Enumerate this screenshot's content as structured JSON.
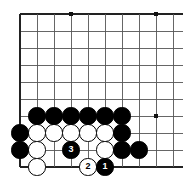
{
  "diagram": {
    "kind": "go-board-diagram",
    "board": {
      "origin_x": 20,
      "origin_y": 14,
      "spacing": 17,
      "cols": 10,
      "rows": 10,
      "left_edge_col": 0,
      "top_edge_row": 0,
      "bottom_edge_row": 9,
      "line_color": "#555555",
      "edge_color": "#222222",
      "background": "#ffffff"
    },
    "star_points": [
      {
        "col": 3,
        "row": 0
      },
      {
        "col": 8,
        "row": 0
      },
      {
        "col": 8,
        "row": 6
      }
    ],
    "stones": [
      {
        "col": 0,
        "row": 7,
        "color": "black",
        "label": ""
      },
      {
        "col": 0,
        "row": 8,
        "color": "black",
        "label": ""
      },
      {
        "col": 1,
        "row": 6,
        "color": "black",
        "label": ""
      },
      {
        "col": 2,
        "row": 6,
        "color": "black",
        "label": ""
      },
      {
        "col": 3,
        "row": 6,
        "color": "black",
        "label": ""
      },
      {
        "col": 4,
        "row": 6,
        "color": "black",
        "label": ""
      },
      {
        "col": 5,
        "row": 6,
        "color": "black",
        "label": ""
      },
      {
        "col": 6,
        "row": 6,
        "color": "black",
        "label": ""
      },
      {
        "col": 6,
        "row": 7,
        "color": "black",
        "label": ""
      },
      {
        "col": 6,
        "row": 8,
        "color": "black",
        "label": ""
      },
      {
        "col": 1,
        "row": 7,
        "color": "white",
        "label": ""
      },
      {
        "col": 2,
        "row": 7,
        "color": "white",
        "label": ""
      },
      {
        "col": 3,
        "row": 7,
        "color": "white",
        "label": ""
      },
      {
        "col": 4,
        "row": 7,
        "color": "white",
        "label": ""
      },
      {
        "col": 5,
        "row": 7,
        "color": "white",
        "label": ""
      },
      {
        "col": 1,
        "row": 8,
        "color": "white",
        "label": ""
      },
      {
        "col": 5,
        "row": 8,
        "color": "white",
        "label": ""
      },
      {
        "col": 1,
        "row": 9,
        "color": "white",
        "label": ""
      },
      {
        "col": 3,
        "row": 8,
        "color": "black",
        "label": "3"
      },
      {
        "col": 4,
        "row": 9,
        "color": "white",
        "label": "2"
      },
      {
        "col": 5,
        "row": 9,
        "color": "black",
        "label": "1"
      },
      {
        "col": 7,
        "row": 8,
        "color": "black",
        "label": ""
      }
    ],
    "move_labels": [
      {
        "number": "1",
        "color": "black"
      },
      {
        "number": "2",
        "color": "white"
      },
      {
        "number": "3",
        "color": "black"
      }
    ]
  }
}
